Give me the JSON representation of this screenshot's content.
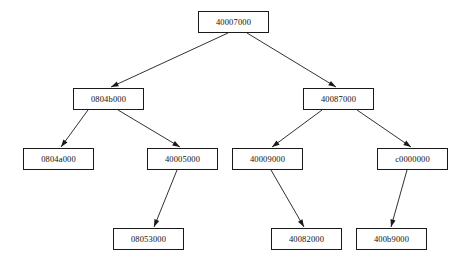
{
  "diagram": {
    "type": "tree",
    "title": "",
    "background_color": "#ffffff",
    "node_border_color": "#1a1a1a",
    "node_fill_color": "#ffffff",
    "edge_color": "#1a1a1a",
    "text_color": "#111111",
    "nodes": [
      {
        "id": "n0",
        "label": "40007000",
        "x": 198,
        "y": 11,
        "w": 71,
        "h": 22,
        "level": 0
      },
      {
        "id": "n1",
        "label": "0804b000",
        "x": 73,
        "y": 88,
        "w": 71,
        "h": 22,
        "level": 1
      },
      {
        "id": "n2",
        "label": "40087000",
        "x": 303,
        "y": 88,
        "w": 71,
        "h": 22,
        "level": 1
      },
      {
        "id": "n3",
        "label": "0804a000",
        "x": 23,
        "y": 148,
        "w": 71,
        "h": 22,
        "level": 2
      },
      {
        "id": "n4",
        "label": "40005000",
        "x": 147,
        "y": 148,
        "w": 71,
        "h": 22,
        "level": 2
      },
      {
        "id": "n5",
        "label": "40009000",
        "x": 232,
        "y": 148,
        "w": 71,
        "h": 22,
        "level": 2
      },
      {
        "id": "n6",
        "label": "c0000000",
        "x": 377,
        "y": 148,
        "w": 71,
        "h": 22,
        "level": 2
      },
      {
        "id": "n7",
        "label": "08053000",
        "x": 113,
        "y": 228,
        "w": 71,
        "h": 22,
        "level": 3
      },
      {
        "id": "n8",
        "label": "40082000",
        "x": 271,
        "y": 228,
        "w": 71,
        "h": 22,
        "level": 3
      },
      {
        "id": "n9",
        "label": "400b9000",
        "x": 356,
        "y": 228,
        "w": 71,
        "h": 22,
        "level": 3
      }
    ],
    "edges": [
      {
        "id": "e0",
        "from": "n0",
        "to": "n1",
        "x1": 228,
        "y1": 33,
        "x2": 111,
        "y2": 87,
        "arrow": true
      },
      {
        "id": "e1",
        "from": "n0",
        "to": "n2",
        "x1": 247,
        "y1": 33,
        "x2": 336,
        "y2": 87,
        "arrow": true
      },
      {
        "id": "e2",
        "from": "n1",
        "to": "n3",
        "x1": 88,
        "y1": 110,
        "x2": 61,
        "y2": 147,
        "arrow": true
      },
      {
        "id": "e3",
        "from": "n1",
        "to": "n4",
        "x1": 118,
        "y1": 110,
        "x2": 180,
        "y2": 147,
        "arrow": true
      },
      {
        "id": "e4",
        "from": "n2",
        "to": "n5",
        "x1": 322,
        "y1": 110,
        "x2": 272,
        "y2": 147,
        "arrow": true
      },
      {
        "id": "e5",
        "from": "n2",
        "to": "n6",
        "x1": 357,
        "y1": 110,
        "x2": 411,
        "y2": 147,
        "arrow": true
      },
      {
        "id": "e6",
        "from": "n4",
        "to": "n7",
        "x1": 177,
        "y1": 170,
        "x2": 154,
        "y2": 227,
        "arrow": true
      },
      {
        "id": "e7",
        "from": "n5",
        "to": "n8",
        "x1": 271,
        "y1": 170,
        "x2": 304,
        "y2": 227,
        "arrow": true
      },
      {
        "id": "e8",
        "from": "n6",
        "to": "n9",
        "x1": 407,
        "y1": 170,
        "x2": 391,
        "y2": 227,
        "arrow": true
      }
    ]
  }
}
